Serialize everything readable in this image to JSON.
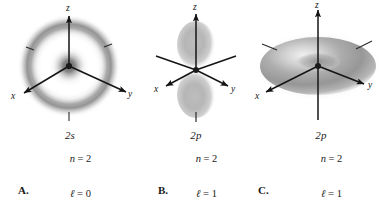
{
  "figure": {
    "background": "#ffffff",
    "ink": "#141414",
    "cloud_color": "#8f8f8f"
  },
  "panels": [
    {
      "id": "A",
      "letter": "A.",
      "orbital": "2s",
      "shape": "concentric-spherical-shells",
      "axes": [
        {
          "name": "z",
          "label": "z",
          "direction": "up"
        },
        {
          "name": "x",
          "label": "x",
          "direction": "down-left"
        },
        {
          "name": "y",
          "label": "y",
          "direction": "down-right"
        }
      ],
      "quantum_numbers": [
        {
          "symbol": "n",
          "relation": "=",
          "value": "2"
        },
        {
          "symbol": "ℓ",
          "relation": "=",
          "value": "0"
        },
        {
          "symbol": "m",
          "relation": "=",
          "value": "0"
        }
      ]
    },
    {
      "id": "B",
      "letter": "B.",
      "orbital": "2p",
      "shape": "dumbbell-along-z",
      "axes": [
        {
          "name": "z",
          "label": "z",
          "direction": "up"
        },
        {
          "name": "x",
          "label": "x",
          "direction": "down-left"
        },
        {
          "name": "y",
          "label": "y",
          "direction": "down-right"
        }
      ],
      "quantum_numbers": [
        {
          "symbol": "n",
          "relation": "=",
          "value": "2"
        },
        {
          "symbol": "ℓ",
          "relation": "=",
          "value": "1"
        },
        {
          "symbol": "m",
          "relation": "=",
          "value": "0"
        }
      ]
    },
    {
      "id": "C",
      "letter": "C.",
      "orbital": "2p",
      "shape": "torus-around-z",
      "axes": [
        {
          "name": "z",
          "label": "z",
          "direction": "up"
        },
        {
          "name": "x",
          "label": "x",
          "direction": "down-left"
        },
        {
          "name": "y",
          "label": "y",
          "direction": "down-right"
        }
      ],
      "quantum_numbers": [
        {
          "symbol": "n",
          "relation": "=",
          "value": "2"
        },
        {
          "symbol": "ℓ",
          "relation": "=",
          "value": "1"
        },
        {
          "symbol": "m",
          "relation": "=",
          "value": "±1"
        }
      ]
    }
  ]
}
